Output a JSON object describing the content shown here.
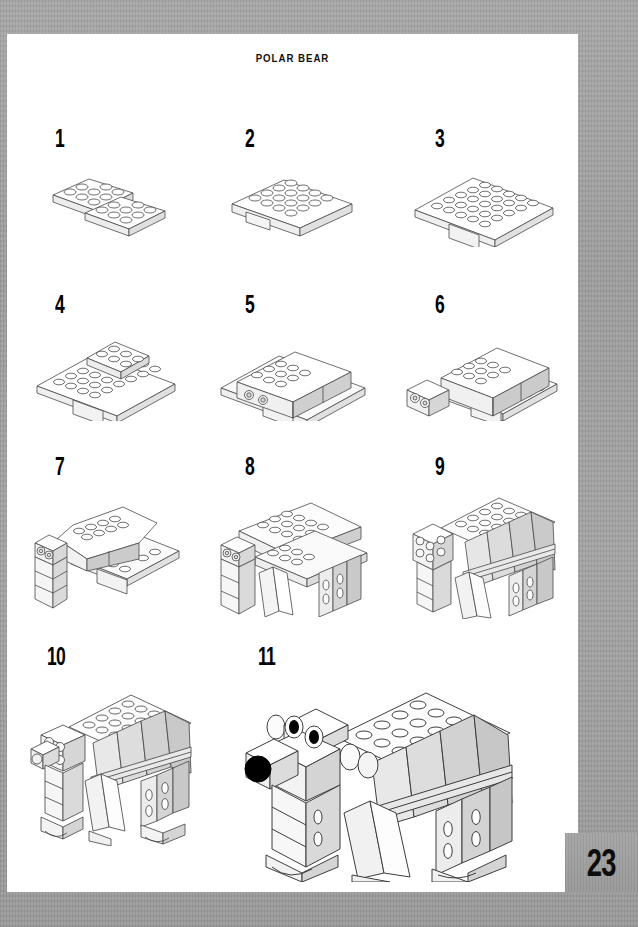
{
  "document": {
    "title": "POLAR BEAR",
    "page_number": "23",
    "page_bg_color": "#9c9c9c",
    "sheet_color": "#ffffff",
    "ink_color": "#1a1a1a"
  },
  "steps": [
    {
      "number": "1",
      "caption": "two 2x4 plates side by side"
    },
    {
      "number": "2",
      "caption": "plates joined into base"
    },
    {
      "number": "3",
      "caption": "larger plate added on top of base"
    },
    {
      "number": "4",
      "caption": "raised 2x4 plate section on base"
    },
    {
      "number": "5",
      "caption": "bricks with pin holes form body wall"
    },
    {
      "number": "6",
      "caption": "body wall extended, head block added at front"
    },
    {
      "number": "7",
      "caption": "front leg column built downward"
    },
    {
      "number": "8",
      "caption": "additional legs attached under body"
    },
    {
      "number": "9",
      "caption": "sloped side panels cover the body"
    },
    {
      "number": "10",
      "caption": "head and feet attached"
    },
    {
      "number": "11",
      "caption": "finished polar bear with eyes and nose"
    }
  ],
  "model": {
    "eye_color": "#000000",
    "nose_color": "#000000",
    "brick_fill": "#ffffff",
    "brick_shade": "#d8d8d8",
    "brick_shade_dark": "#bdbdbd",
    "outline": "#3a3a3a"
  }
}
